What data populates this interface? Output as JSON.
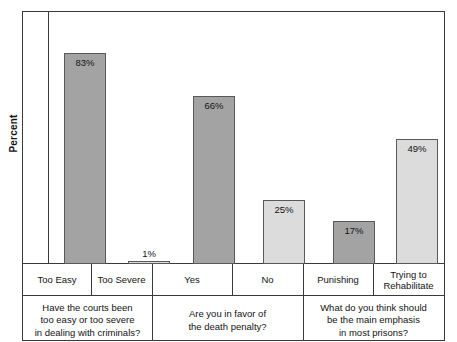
{
  "chart_data": {
    "type": "bar",
    "title": "",
    "subtitle": "",
    "xlabel": "",
    "ylabel": "Percent",
    "ylim": [
      0,
      100
    ],
    "grid": false,
    "legend": "none",
    "categories": [
      "Too Easy",
      "Too Severe",
      "Yes",
      "No",
      "Punishing",
      "Trying to Rehabilitate"
    ],
    "values": [
      83,
      1,
      66,
      25,
      17,
      49
    ],
    "value_labels": [
      "83%",
      "1%",
      "66%",
      "25%",
      "17%",
      "49%"
    ],
    "bar_colors": [
      "#a3a3a3",
      "#dcdcdc",
      "#a3a3a3",
      "#dcdcdc",
      "#a3a3a3",
      "#dcdcdc"
    ],
    "groups": [
      {
        "question": "Have the courts been too easy or too severe in dealing with criminals?",
        "question_lines": [
          "Have the courts been",
          "too easy or too severe",
          "in dealing with criminals?"
        ],
        "categories": [
          "Too Easy",
          "Too Severe"
        ],
        "values": [
          83,
          1
        ]
      },
      {
        "question": "Are you in favor of the death penalty?",
        "question_lines": [
          "Are you in favor of",
          "the death penalty?"
        ],
        "categories": [
          "Yes",
          "No"
        ],
        "values": [
          66,
          25
        ]
      },
      {
        "question": "What do you think should be the main emphasis in most prisons?",
        "question_lines": [
          "What do you think should",
          "be the main emphasis",
          "in most prisons?"
        ],
        "categories": [
          "Punishing",
          "Trying to Rehabilitate"
        ],
        "values": [
          17,
          49
        ]
      }
    ],
    "annotations": []
  },
  "axis": {
    "y_title": "Percent"
  },
  "bars": [
    {
      "label": "83%",
      "category": "Too Easy",
      "value": 83,
      "shade": "dark",
      "left": 16,
      "width": 42,
      "label_inside": true
    },
    {
      "label": "1%",
      "category": "Too Severe",
      "value": 1,
      "shade": "light",
      "left": 80,
      "width": 42,
      "label_inside": false
    },
    {
      "label": "66%",
      "category": "Yes",
      "value": 66,
      "shade": "dark",
      "left": 145,
      "width": 42,
      "label_inside": true
    },
    {
      "label": "25%",
      "category": "No",
      "value": 25,
      "shade": "light",
      "left": 215,
      "width": 42,
      "label_inside": true
    },
    {
      "label": "17%",
      "category": "Punishing",
      "value": 17,
      "shade": "dark",
      "left": 285,
      "width": 42,
      "label_inside": true
    },
    {
      "label": "49%",
      "category": "Trying to Rehabilitate",
      "value": 49,
      "shade": "light",
      "left": 348,
      "width": 42,
      "label_inside": true
    }
  ],
  "category_cells": [
    {
      "text": "Too Easy",
      "left": 0,
      "width": 68,
      "lines": [
        "Too Easy"
      ]
    },
    {
      "text": "Too Severe",
      "left": 68,
      "width": 61,
      "lines": [
        "Too Severe"
      ]
    },
    {
      "text": "Yes",
      "left": 129,
      "width": 80,
      "lines": [
        "Yes"
      ]
    },
    {
      "text": "No",
      "left": 209,
      "width": 71,
      "lines": [
        "No"
      ]
    },
    {
      "text": "Punishing",
      "left": 280,
      "width": 70,
      "lines": [
        "Punishing"
      ]
    },
    {
      "text": "Trying to Rehabilitate",
      "left": 350,
      "width": 71,
      "lines": [
        "Trying to",
        "Rehabilitate"
      ]
    }
  ],
  "question_cells": [
    {
      "left": 0,
      "width": 129,
      "lines": [
        "Have the courts been",
        "too easy or too severe",
        "in dealing with criminals?"
      ]
    },
    {
      "left": 129,
      "width": 151,
      "lines": [
        "Are you in favor of",
        "the death penalty?"
      ]
    },
    {
      "left": 280,
      "width": 141,
      "lines": [
        "What do you think should",
        "be the main emphasis",
        "in most prisons?"
      ]
    }
  ],
  "separators": [
    {
      "left": 68,
      "kind": "cat"
    },
    {
      "left": 129,
      "kind": "full"
    },
    {
      "left": 209,
      "kind": "cat"
    },
    {
      "left": 280,
      "kind": "full"
    },
    {
      "left": 350,
      "kind": "cat"
    }
  ],
  "colors": {
    "dark_bar": "#a3a3a3",
    "light_bar": "#dcdcdc",
    "bar_outline": "#595959",
    "frame": "#3a3a3a",
    "text": "#131313",
    "background": "#ffffff"
  }
}
